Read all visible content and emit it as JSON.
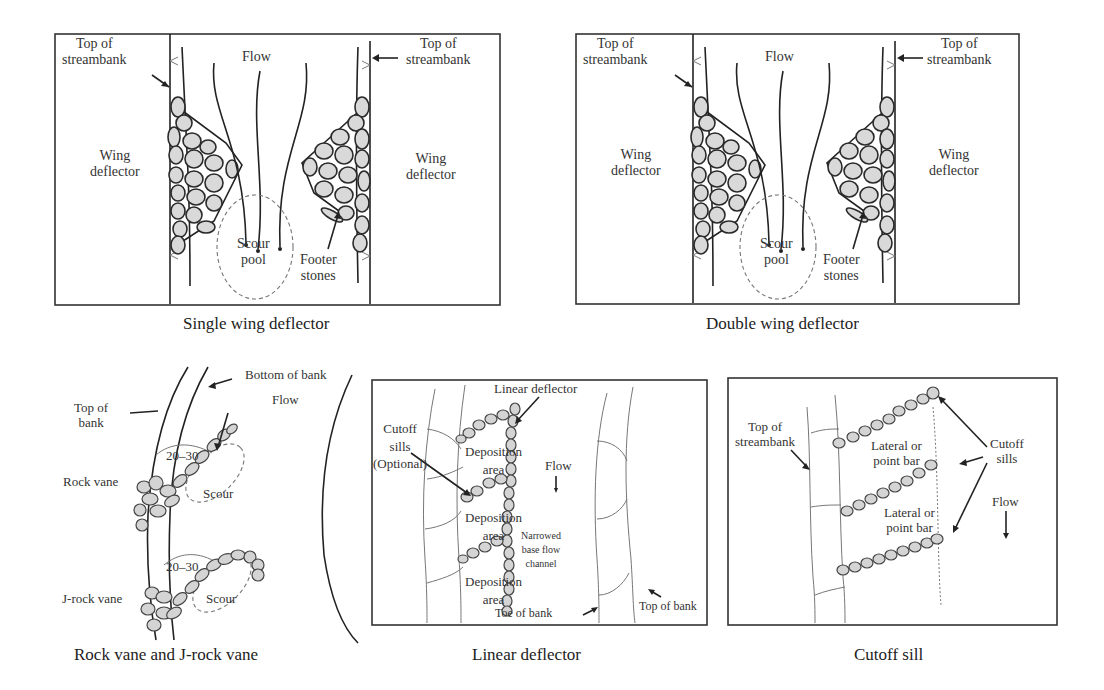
{
  "figure": {
    "panels": [
      {
        "id": "single-wing",
        "caption": "Single wing deflector",
        "labels": {
          "top_left": "Top of\nstreambank",
          "top_right": "Top of\nstreambank",
          "flow": "Flow",
          "wing_left": "Wing\ndeflector",
          "wing_right": "Wing\ndeflector",
          "scour_pool": "Scour\npool",
          "footer_stones": "Footer\nstones"
        }
      },
      {
        "id": "double-wing",
        "caption": "Double wing deflector",
        "labels": {
          "top_left": "Top of\nstreambank",
          "top_right": "Top of\nstreambank",
          "flow": "Flow",
          "wing_left": "Wing\ndeflector",
          "wing_right": "Wing\ndeflector",
          "scour_pool": "Scour\npool",
          "footer_stones": "Footer\nstones"
        }
      },
      {
        "id": "rock-vane",
        "caption": "Rock vane and J-rock vane",
        "labels": {
          "bottom_of_bank": "Bottom of bank",
          "top_of_bank": "Top of\nbank",
          "flow": "Flow",
          "angle_1": "20–30",
          "angle_2": "20–30",
          "rock_vane": "Rock vane",
          "j_rock_vane": "J-rock vane",
          "scour_1": "Scour",
          "scour_2": "Scour"
        }
      },
      {
        "id": "linear-deflector",
        "caption": "Linear deflector",
        "labels": {
          "linear_deflector": "Linear deflector",
          "cutoff_sills": "Cutoff\nsills\n(Optional)",
          "deposition_1": "Deposition\narea",
          "deposition_2": "Deposition\narea",
          "deposition_3": "Deposition\narea",
          "flow": "Flow",
          "narrowed_channel": "Narrowed\nbase flow\nchannel",
          "toe_of_bank": "Toe of bank",
          "top_of_bank": "Top of bank"
        }
      },
      {
        "id": "cutoff-sill",
        "caption": "Cutoff sill",
        "labels": {
          "top_of_streambank": "Top of\nstreambank",
          "lateral_bar_1": "Lateral or\npoint bar",
          "lateral_bar_2": "Lateral or\npoint bar",
          "cutoff_sills": "Cutoff\nsills",
          "flow": "Flow"
        }
      }
    ]
  }
}
